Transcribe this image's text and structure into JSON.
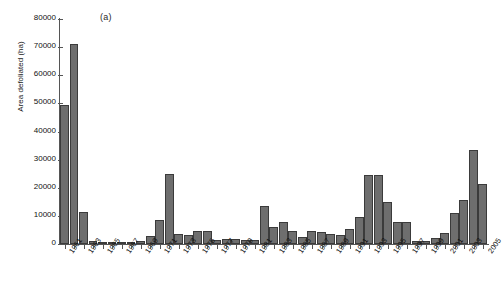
{
  "figure": {
    "panel_label": "(a)",
    "caption_fragment": ""
  },
  "chart_data": {
    "type": "bar",
    "title": "",
    "subtitle": "",
    "xlabel": "",
    "ylabel": "Area defoliated (ha)",
    "ylim": [
      0,
      80000
    ],
    "ytick_labels": [
      "0",
      "10000",
      "20000",
      "30000",
      "40000",
      "50000",
      "60000",
      "70000",
      "80000"
    ],
    "ytick_values": [
      0,
      10000,
      20000,
      30000,
      40000,
      50000,
      60000,
      70000,
      80000
    ],
    "xtick_labels": [
      "1961",
      "1963",
      "1965",
      "1967",
      "1969",
      "1971",
      "1973",
      "1975",
      "1977",
      "1979",
      "1981",
      "1983",
      "1985",
      "1987",
      "1989",
      "1991",
      "1993",
      "1995",
      "1997",
      "1999",
      "2001",
      "2003",
      "2005"
    ],
    "grid": false,
    "legend": null,
    "bar_color": "#6e6e6e",
    "bar_edge_color": "#3b3b3b",
    "categories": [
      1961,
      1962,
      1963,
      1964,
      1965,
      1966,
      1967,
      1968,
      1969,
      1970,
      1971,
      1972,
      1973,
      1974,
      1975,
      1976,
      1977,
      1978,
      1979,
      1980,
      1981,
      1982,
      1983,
      1984,
      1985,
      1986,
      1987,
      1988,
      1989,
      1990,
      1991,
      1992,
      1993,
      1994,
      1995,
      1996,
      1997,
      1998,
      1999,
      2000,
      2001,
      2002,
      2003,
      2004,
      2005
    ],
    "values": [
      49500,
      71000,
      11500,
      900,
      700,
      200,
      150,
      300,
      900,
      2800,
      8500,
      25000,
      3500,
      3300,
      4800,
      4500,
      1600,
      1900,
      1900,
      1300,
      1300,
      13500,
      6000,
      8000,
      4500,
      2600,
      4800,
      4200,
      3400,
      3200,
      5200,
      9500,
      24500,
      24400,
      15000,
      7700,
      7800,
      1000,
      900,
      2200,
      3900,
      11000,
      15800,
      33500,
      21500
    ]
  }
}
